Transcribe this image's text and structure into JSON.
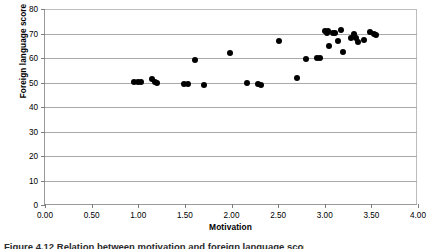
{
  "chart_data": {
    "type": "scatter",
    "title": "",
    "xlabel": "Motivation",
    "ylabel": "Foreign language score",
    "xlim": [
      0,
      4
    ],
    "ylim": [
      0,
      80
    ],
    "grid": true,
    "legend": null,
    "marker": {
      "shape": "circle",
      "color": "#000000",
      "size": 6
    },
    "xticks": [
      "0.00",
      "0.50",
      "1.00",
      "1.50",
      "2.00",
      "2.50",
      "3.00",
      "3.50",
      "4.00"
    ],
    "xtick_values": [
      0,
      0.5,
      1,
      1.5,
      2,
      2.5,
      3,
      3.5,
      4
    ],
    "yticks": [
      "0",
      "10",
      "20",
      "30",
      "40",
      "50",
      "60",
      "70",
      "80"
    ],
    "ytick_values": [
      0,
      10,
      20,
      30,
      40,
      50,
      60,
      70,
      80
    ],
    "points": [
      {
        "x": 0.95,
        "y": 50.4
      },
      {
        "x": 1.0,
        "y": 50.3
      },
      {
        "x": 1.03,
        "y": 50.2
      },
      {
        "x": 1.15,
        "y": 51.3
      },
      {
        "x": 1.18,
        "y": 50.4
      },
      {
        "x": 1.2,
        "y": 49.6
      },
      {
        "x": 1.49,
        "y": 49.2
      },
      {
        "x": 1.53,
        "y": 49.2
      },
      {
        "x": 1.61,
        "y": 59.3
      },
      {
        "x": 1.7,
        "y": 49.1
      },
      {
        "x": 1.98,
        "y": 62.0
      },
      {
        "x": 2.17,
        "y": 49.9
      },
      {
        "x": 2.28,
        "y": 49.3
      },
      {
        "x": 2.32,
        "y": 49.0
      },
      {
        "x": 2.51,
        "y": 66.8
      },
      {
        "x": 2.7,
        "y": 51.7
      },
      {
        "x": 2.8,
        "y": 59.6
      },
      {
        "x": 2.92,
        "y": 60.2
      },
      {
        "x": 2.95,
        "y": 60.0
      },
      {
        "x": 3.0,
        "y": 71.2
      },
      {
        "x": 3.02,
        "y": 70.3
      },
      {
        "x": 3.04,
        "y": 70.9
      },
      {
        "x": 3.05,
        "y": 64.9
      },
      {
        "x": 3.09,
        "y": 70.2
      },
      {
        "x": 3.11,
        "y": 70.3
      },
      {
        "x": 3.14,
        "y": 66.9
      },
      {
        "x": 3.17,
        "y": 71.4
      },
      {
        "x": 3.2,
        "y": 62.4
      },
      {
        "x": 3.28,
        "y": 68.1
      },
      {
        "x": 3.31,
        "y": 69.8
      },
      {
        "x": 3.33,
        "y": 68.3
      },
      {
        "x": 3.36,
        "y": 66.6
      },
      {
        "x": 3.42,
        "y": 67.4
      },
      {
        "x": 3.49,
        "y": 70.6
      },
      {
        "x": 3.53,
        "y": 69.8
      },
      {
        "x": 3.55,
        "y": 69.4
      }
    ]
  },
  "caption": {
    "text": "Figure 4.12  Relation between motivation and foreign language score"
  }
}
